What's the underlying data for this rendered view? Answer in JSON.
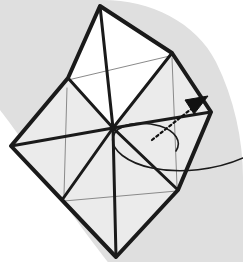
{
  "figure": {
    "title": "Origami fold step diagram",
    "type": "origami-instruction-diagram",
    "canvas": {
      "width": 243,
      "height": 262
    },
    "caption": ""
  },
  "colors": {
    "background": "#ffffff",
    "shadow_gray": "#dfdfdf",
    "paper_white": "#ffffff",
    "paper_shaded": "#ebebeb",
    "crease_heavy": "#1a1a1a",
    "crease_light": "#8a8a8a",
    "arrow": "#111111"
  },
  "shadow": {
    "name": "background-shadow-band",
    "description": "Soft gray band sweeping from the upper-left edge down to the lower-right, with a rounded lobe behind the upper-right of the model.",
    "path": "M 0,0 L 103,0 C 150,0 196,22 216,62 C 234,98 243,140 243,178 L 243,262 L 108,262 C 108,262 70,214 42,170 C 22,138 6,118 0,110 Z"
  },
  "model": {
    "name": "folded-square-model",
    "description": "Square sheet rotated 45 degrees, pre-creased into eight triangles meeting at the center.",
    "vertices": {
      "top": {
        "x": 100,
        "y": 6
      },
      "right": {
        "x": 211,
        "y": 112
      },
      "bottom": {
        "x": 116,
        "y": 257
      },
      "left": {
        "x": 11,
        "y": 146
      },
      "center": {
        "x": 113,
        "y": 128
      },
      "upper_left_mid": {
        "x": 68,
        "y": 78
      },
      "upper_right_mid": {
        "x": 172,
        "y": 53
      },
      "lower_right_mid": {
        "x": 178,
        "y": 190
      },
      "lower_left_mid": {
        "x": 62,
        "y": 200
      }
    },
    "outline_path": "M 100,6 L 172,53 L 211,112 L 178,190 L 116,257 L 62,200 L 11,146 L 68,78 Z"
  },
  "facets": [
    {
      "name": "facet-top-left",
      "fill": "paper_white",
      "path": "M 100,6 L 113,128 L 68,78 Z"
    },
    {
      "name": "facet-top-right",
      "fill": "paper_white",
      "path": "M 100,6 L 172,53 L 113,128 Z"
    },
    {
      "name": "facet-right-upper",
      "fill": "paper_shaded",
      "path": "M 172,53 L 211,112 L 113,128 Z"
    },
    {
      "name": "facet-right-lower",
      "fill": "paper_shaded",
      "path": "M 211,112 L 178,190 L 113,128 Z"
    },
    {
      "name": "facet-bottom-right",
      "fill": "paper_shaded",
      "path": "M 178,190 L 116,257 L 113,128 Z"
    },
    {
      "name": "facet-bottom-left",
      "fill": "paper_shaded",
      "path": "M 116,257 L 62,200 L 113,128 Z"
    },
    {
      "name": "facet-left-lower",
      "fill": "paper_shaded",
      "path": "M 62,200 L 11,146 L 113,128 Z"
    },
    {
      "name": "facet-left-upper",
      "fill": "paper_shaded",
      "path": "M 11,146 L 68,78 L 113,128 Z"
    }
  ],
  "creases_heavy": [
    {
      "name": "crease-top-to-center",
      "path": "M 100,6 L 113,128"
    },
    {
      "name": "crease-upper-left-mid-to-center",
      "path": "M 68,78 L 113,128"
    },
    {
      "name": "crease-upper-right-mid-to-center",
      "path": "M 172,53 L 113,128"
    },
    {
      "name": "crease-right-to-center",
      "path": "M 211,112 L 113,128"
    },
    {
      "name": "crease-lower-right-mid-to-center",
      "path": "M 178,190 L 113,128"
    },
    {
      "name": "crease-bottom-to-center",
      "path": "M 113,128 L 116,257"
    },
    {
      "name": "crease-lower-left-mid-to-center",
      "path": "M 62,200 L 113,128"
    },
    {
      "name": "crease-left-to-center",
      "path": "M 11,146 L 113,128"
    }
  ],
  "creases_light": [
    {
      "name": "thin-crease-upper-chord",
      "path": "M 68,80 L 174,55"
    },
    {
      "name": "thin-crease-lower-chord",
      "path": "M 64,201 L 177,191"
    },
    {
      "name": "thin-crease-left-vertical",
      "path": "M 67,88 L 64,195"
    },
    {
      "name": "thin-crease-right-vertical",
      "path": "M 172,58 L 177,186"
    },
    {
      "name": "thin-crease-center-vertical-upper",
      "path": "M 100,10 L 113,128"
    },
    {
      "name": "thin-crease-center-vertical-lower",
      "path": "M 113,128 L 116,253"
    }
  ],
  "arrow": {
    "name": "fold-direction-arrow",
    "style": "dashed-with-solid-head",
    "description": "Dotted arrow pointing up and to the right indicating the flap swings over.",
    "shaft_path": "M 152,140 L 200,102",
    "head_path": "M 208,96 L 185,100 L 194,114 Z",
    "tip": {
      "x": 208,
      "y": 96
    },
    "dash_pattern": "2.5 3"
  },
  "loop": {
    "name": "rotation-loop-line",
    "description": "Thin solid curve looping beneath the arrow and running off the right edge, showing the flap path behind the model.",
    "path": "M 243,158 C 216,170 180,174 152,168 C 128,163 110,150 113,137 C 116,124 140,120 160,126 C 176,131 182,142 176,151"
  },
  "labels": {
    "step_number": "",
    "annotation": ""
  }
}
